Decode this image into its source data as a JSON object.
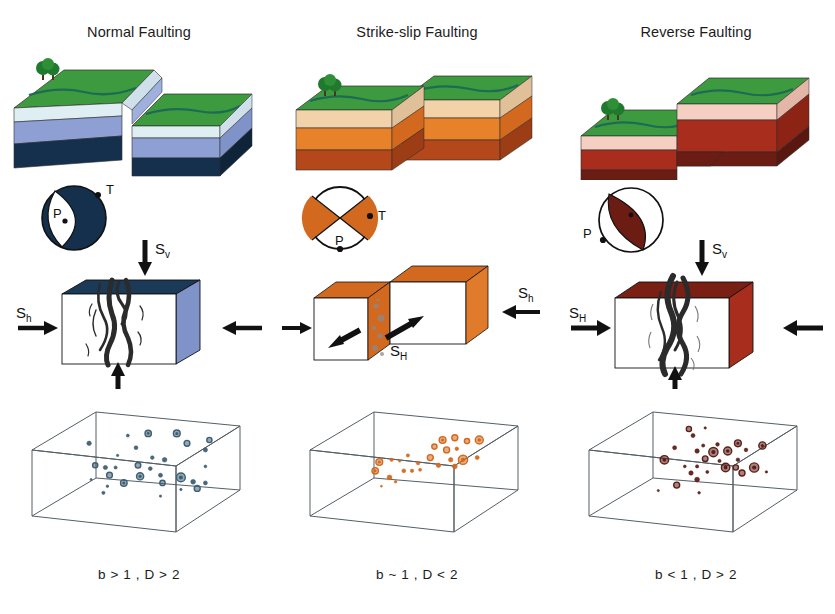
{
  "figure": {
    "title_normal": "Normal Faulting",
    "title_strike": "Strike-slip Faulting",
    "title_reverse": "Reverse Faulting",
    "caption_normal": "b > 1 , D > 2",
    "caption_strike": "b ~ 1 , D < 2",
    "caption_reverse": "b < 1 , D > 2"
  },
  "stress_labels": {
    "normal_vertical": "S",
    "normal_vertical_sub": "v",
    "normal_horizontal": "S",
    "normal_horizontal_sub": "h",
    "strike_major": "S",
    "strike_major_sub": "H",
    "strike_minor": "S",
    "strike_minor_sub": "h",
    "reverse_vertical": "S",
    "reverse_vertical_sub": "v",
    "reverse_horizontal": "S",
    "reverse_horizontal_sub": "H"
  },
  "beachball_labels": {
    "normal_t": "T",
    "normal_p": "P",
    "strike_t": "T",
    "strike_p": "P",
    "reverse_p": "P"
  },
  "colors": {
    "normal_grass": "#3d9a3f",
    "normal_river": "#1d6b54",
    "normal_layer2": "#dfeef2",
    "normal_layer3": "#8e9fd4",
    "normal_layer4": "#15304d",
    "normal_side_dark": "#1b3a57",
    "normal_side_blue": "#7f93c8",
    "normal_dot": "#3d5f74",
    "strike_grass": "#3d9a3f",
    "strike_layer2": "#f2d2a8",
    "strike_layer3": "#e8822a",
    "strike_layer4": "#b5481b",
    "strike_side": "#d2691e",
    "strike_dot": "#d2691e",
    "reverse_grass": "#3d9a3f",
    "reverse_layer2": "#f6cfc3",
    "reverse_layer3": "#a82d1c",
    "reverse_layer4": "#6b1c13",
    "reverse_side": "#7a1f14",
    "reverse_dot": "#5c1f18",
    "box_edge": "#555f66",
    "fracture": "#2b2b2b"
  },
  "chart_data": [
    {
      "type": "scatter",
      "title": "b > 1 , D > 2",
      "description": "Diffuse three-dimensional distribution of small earthquakes inside cube",
      "points": [
        {
          "x": 0.46,
          "y": 0.84,
          "r": 1.5
        },
        {
          "x": 0.56,
          "y": 0.86,
          "r": 3.2
        },
        {
          "x": 0.7,
          "y": 0.86,
          "r": 3.4
        },
        {
          "x": 0.86,
          "y": 0.8,
          "r": 2.6
        },
        {
          "x": 0.27,
          "y": 0.77,
          "r": 2.2
        },
        {
          "x": 0.75,
          "y": 0.77,
          "r": 2.9
        },
        {
          "x": 0.5,
          "y": 0.73,
          "r": 1.9
        },
        {
          "x": 0.84,
          "y": 0.71,
          "r": 2.1
        },
        {
          "x": 0.41,
          "y": 0.66,
          "r": 1.2
        },
        {
          "x": 0.58,
          "y": 0.64,
          "r": 1.8
        },
        {
          "x": 0.64,
          "y": 0.62,
          "r": 2.3
        },
        {
          "x": 0.3,
          "y": 0.57,
          "r": 2.6
        },
        {
          "x": 0.35,
          "y": 0.55,
          "r": 2.1
        },
        {
          "x": 0.4,
          "y": 0.55,
          "r": 1.6
        },
        {
          "x": 0.51,
          "y": 0.57,
          "r": 2.8
        },
        {
          "x": 0.57,
          "y": 0.54,
          "r": 1.9
        },
        {
          "x": 0.84,
          "y": 0.56,
          "r": 1.4
        },
        {
          "x": 0.37,
          "y": 0.48,
          "r": 2.9
        },
        {
          "x": 0.52,
          "y": 0.47,
          "r": 3.6
        },
        {
          "x": 0.62,
          "y": 0.48,
          "r": 2.0
        },
        {
          "x": 0.72,
          "y": 0.46,
          "r": 4.4
        },
        {
          "x": 0.28,
          "y": 0.44,
          "r": 1.1
        },
        {
          "x": 0.44,
          "y": 0.41,
          "r": 3.3
        },
        {
          "x": 0.63,
          "y": 0.41,
          "r": 2.7
        },
        {
          "x": 0.78,
          "y": 0.42,
          "r": 2.4
        },
        {
          "x": 0.84,
          "y": 0.41,
          "r": 2.0
        },
        {
          "x": 0.36,
          "y": 0.38,
          "r": 1.3
        },
        {
          "x": 0.72,
          "y": 0.35,
          "r": 1.2
        },
        {
          "x": 0.8,
          "y": 0.36,
          "r": 3.0
        },
        {
          "x": 0.34,
          "y": 0.32,
          "r": 1.6
        },
        {
          "x": 0.62,
          "y": 0.29,
          "r": 1.2
        }
      ]
    },
    {
      "type": "scatter",
      "title": "b ~ 1 , D < 2",
      "description": "Earthquakes concentrated along a narrow planar fault zone",
      "points": [
        {
          "x": 0.64,
          "y": 0.8,
          "r": 3.4
        },
        {
          "x": 0.7,
          "y": 0.82,
          "r": 3.0
        },
        {
          "x": 0.76,
          "y": 0.79,
          "r": 2.6
        },
        {
          "x": 0.82,
          "y": 0.8,
          "r": 4.0
        },
        {
          "x": 0.6,
          "y": 0.74,
          "r": 2.6
        },
        {
          "x": 0.66,
          "y": 0.71,
          "r": 3.0
        },
        {
          "x": 0.71,
          "y": 0.72,
          "r": 1.8
        },
        {
          "x": 0.47,
          "y": 0.66,
          "r": 1.6
        },
        {
          "x": 0.58,
          "y": 0.64,
          "r": 3.0
        },
        {
          "x": 0.68,
          "y": 0.62,
          "r": 2.2
        },
        {
          "x": 0.74,
          "y": 0.62,
          "r": 4.6
        },
        {
          "x": 0.81,
          "y": 0.64,
          "r": 2.0
        },
        {
          "x": 0.33,
          "y": 0.6,
          "r": 3.4
        },
        {
          "x": 0.39,
          "y": 0.62,
          "r": 1.6
        },
        {
          "x": 0.43,
          "y": 0.61,
          "r": 1.2
        },
        {
          "x": 0.52,
          "y": 0.59,
          "r": 1.8
        },
        {
          "x": 0.62,
          "y": 0.57,
          "r": 2.2
        },
        {
          "x": 0.7,
          "y": 0.56,
          "r": 2.4
        },
        {
          "x": 0.31,
          "y": 0.52,
          "r": 3.2
        },
        {
          "x": 0.45,
          "y": 0.52,
          "r": 1.9
        },
        {
          "x": 0.49,
          "y": 0.52,
          "r": 1.7
        },
        {
          "x": 0.53,
          "y": 0.53,
          "r": 1.5
        },
        {
          "x": 0.38,
          "y": 0.46,
          "r": 2.4
        },
        {
          "x": 0.41,
          "y": 0.42,
          "r": 1.3
        },
        {
          "x": 0.34,
          "y": 0.38,
          "r": 1.0
        }
      ]
    },
    {
      "type": "scatter",
      "title": "b < 1 , D > 2",
      "description": "Large events clustered in a three-dimensional volume",
      "points": [
        {
          "x": 0.48,
          "y": 0.9,
          "r": 2.6
        },
        {
          "x": 0.56,
          "y": 0.91,
          "r": 1.2
        },
        {
          "x": 0.5,
          "y": 0.84,
          "r": 2.0
        },
        {
          "x": 0.41,
          "y": 0.73,
          "r": 2.0
        },
        {
          "x": 0.55,
          "y": 0.75,
          "r": 1.6
        },
        {
          "x": 0.62,
          "y": 0.76,
          "r": 1.8
        },
        {
          "x": 0.72,
          "y": 0.77,
          "r": 3.4
        },
        {
          "x": 0.84,
          "y": 0.75,
          "r": 3.6
        },
        {
          "x": 0.52,
          "y": 0.7,
          "r": 2.2
        },
        {
          "x": 0.6,
          "y": 0.69,
          "r": 4.6
        },
        {
          "x": 0.67,
          "y": 0.7,
          "r": 4.0
        },
        {
          "x": 0.76,
          "y": 0.71,
          "r": 1.8
        },
        {
          "x": 0.36,
          "y": 0.62,
          "r": 4.2
        },
        {
          "x": 0.56,
          "y": 0.63,
          "r": 2.8
        },
        {
          "x": 0.63,
          "y": 0.61,
          "r": 1.6
        },
        {
          "x": 0.72,
          "y": 0.62,
          "r": 1.8
        },
        {
          "x": 0.46,
          "y": 0.56,
          "r": 1.4
        },
        {
          "x": 0.52,
          "y": 0.56,
          "r": 1.6
        },
        {
          "x": 0.66,
          "y": 0.55,
          "r": 4.2
        },
        {
          "x": 0.71,
          "y": 0.55,
          "r": 2.6
        },
        {
          "x": 0.8,
          "y": 0.55,
          "r": 4.6
        },
        {
          "x": 0.49,
          "y": 0.5,
          "r": 2.2
        },
        {
          "x": 0.57,
          "y": 0.51,
          "r": 1.5
        },
        {
          "x": 0.74,
          "y": 0.5,
          "r": 3.0
        },
        {
          "x": 0.86,
          "y": 0.51,
          "r": 1.2
        },
        {
          "x": 0.52,
          "y": 0.44,
          "r": 2.4
        },
        {
          "x": 0.42,
          "y": 0.39,
          "r": 3.0
        },
        {
          "x": 0.33,
          "y": 0.34,
          "r": 1.1
        },
        {
          "x": 0.53,
          "y": 0.32,
          "r": 1.3
        }
      ]
    }
  ]
}
